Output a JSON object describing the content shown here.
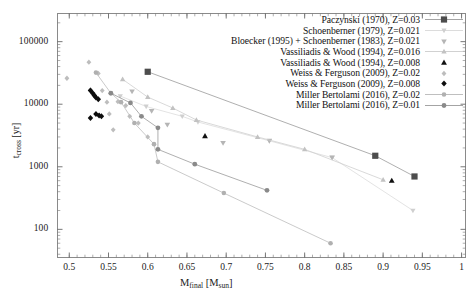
{
  "figure": {
    "title_fragment": "",
    "xlabel_main": "M",
    "xlabel_sub": "final",
    "xlabel_unit": "[M",
    "xlabel_unit_sub": "sun",
    "xlabel_unit_end": "]",
    "ylabel_main": "t",
    "ylabel_sub": "cross",
    "ylabel_unit": "[yr]"
  },
  "axes": {
    "x_ticks": [
      "0.5",
      "0.55",
      "0.6",
      "0.65",
      "0.7",
      "0.75",
      "0.8",
      "0.85",
      "0.9",
      "0.95",
      "1"
    ],
    "y_ticks": [
      "100000",
      "10000",
      "1000",
      "100"
    ],
    "xlim": [
      0.485,
      1.005
    ],
    "ylim_log": [
      1.55,
      5.45
    ],
    "yscale": "log",
    "grid": false
  },
  "legend": {
    "position": "top-right",
    "entries": [
      {
        "label": "Paczynski (1970), Z=0.03",
        "marker": "square",
        "color": "#4d4d4d",
        "size": 6.2,
        "line": true,
        "line_color": "#9a9a9a"
      },
      {
        "label": "Schoenberner (1979), Z=0.021",
        "marker": "tri-down",
        "color": "#cfcfcf",
        "size": 4.6,
        "line": true,
        "line_color": "#d8d8d8"
      },
      {
        "label": "Bloecker (1995) + Schoenberner (1983), Z=0.021",
        "marker": "tri-down",
        "color": "#b5b5b5",
        "size": 5.0,
        "line": false,
        "line_color": "#c8c8c8"
      },
      {
        "label": "Vassiliadis & Wood (1994), Z=0.016",
        "marker": "tri-up",
        "color": "#c2c2c2",
        "size": 4.8,
        "line": true,
        "line_color": "#cccccc"
      },
      {
        "label": "Vassiliadis & Wood (1994), Z=0.008",
        "marker": "tri-up",
        "color": "#111111",
        "size": 5.2,
        "line": false,
        "line_color": "#999999"
      },
      {
        "label": "Weiss & Ferguson (2009), Z=0.02",
        "marker": "diamond",
        "color": "#bdbdbd",
        "size": 4.6,
        "line": false,
        "line_color": "#bdbdbd"
      },
      {
        "label": "Weiss & Ferguson (2009), Z=0.008",
        "marker": "diamond",
        "color": "#0d0d0d",
        "size": 5.2,
        "line": false,
        "line_color": "#0d0d0d"
      },
      {
        "label": "Miller Bertolami (2016), Z=0.02",
        "marker": "circle",
        "color": "#b0b0b0",
        "size": 4.6,
        "line": true,
        "line_color": "#b8b8b8"
      },
      {
        "label": "Miller Bertolami (2016), Z=0.01",
        "marker": "circle",
        "color": "#8a8a8a",
        "size": 4.8,
        "line": true,
        "line_color": "#9a9a9a"
      }
    ]
  },
  "chart_data": {
    "type": "scatter",
    "title": "",
    "xlabel": "M_final [M_sun]",
    "ylabel": "t_cross [yr]",
    "yscale": "log",
    "xlim": [
      0.485,
      1.005
    ],
    "ylim": [
      40,
      300000
    ],
    "grid": false,
    "series": [
      {
        "name": "Paczynski (1970), Z=0.03",
        "marker": "square",
        "color": "#4d4d4d",
        "line": true,
        "line_color": "#9a9a9a",
        "points": [
          [
            0.6,
            33000
          ],
          [
            0.89,
            1500
          ],
          [
            0.94,
            700
          ]
        ]
      },
      {
        "name": "Schoenberner (1979), Z=0.021",
        "marker": "tri-down",
        "color": "#cfcfcf",
        "line": true,
        "line_color": "#dcdcdc",
        "points": [
          [
            0.565,
            13500
          ],
          [
            0.598,
            9200
          ],
          [
            0.644,
            6400
          ],
          [
            0.664,
            5200
          ],
          [
            0.755,
            2600
          ],
          [
            0.835,
            1400
          ],
          [
            0.938,
            200
          ]
        ]
      },
      {
        "name": "Bloecker (1995) + Schoenberner (1983), Z=0.021",
        "marker": "tri-down",
        "color": "#b5b5b5",
        "line": false,
        "line_color": "#c8c8c8",
        "points": [
          [
            0.58,
            16000
          ],
          [
            0.605,
            7800
          ],
          [
            0.625,
            4700
          ],
          [
            0.696,
            2400
          ],
          [
            0.755,
            2600
          ],
          [
            0.835,
            1400
          ]
        ]
      },
      {
        "name": "Vassiliadis & Wood (1994), Z=0.016",
        "marker": "tri-up",
        "color": "#c2c2c2",
        "line": true,
        "line_color": "#cfcfcf",
        "points": [
          [
            0.568,
            25000
          ],
          [
            0.6,
            13000
          ],
          [
            0.632,
            8700
          ],
          [
            0.662,
            5600
          ],
          [
            0.74,
            3000
          ],
          [
            0.8,
            1900
          ],
          [
            0.9,
            620
          ]
        ]
      },
      {
        "name": "Vassiliadis & Wood (1994), Z=0.008",
        "marker": "tri-up",
        "color": "#111111",
        "line": false,
        "line_color": "#999999",
        "points": [
          [
            0.673,
            3100
          ],
          [
            0.911,
            600
          ]
        ]
      },
      {
        "name": "Weiss & Ferguson (2009), Z=0.02",
        "marker": "diamond",
        "color": "#bdbdbd",
        "line": false,
        "line_color": "#bdbdbd",
        "points": [
          [
            0.497,
            26000
          ],
          [
            0.525,
            47000
          ],
          [
            0.527,
            17000
          ],
          [
            0.53,
            14500
          ],
          [
            0.537,
            31000
          ],
          [
            0.542,
            16500
          ],
          [
            0.548,
            10800
          ],
          [
            0.551,
            7000
          ],
          [
            0.556,
            3900
          ],
          [
            0.562,
            11000
          ],
          [
            0.572,
            9500
          ],
          [
            0.577,
            6400
          ],
          [
            0.588,
            5000
          ],
          [
            0.6,
            3000
          ]
        ]
      },
      {
        "name": "Weiss & Ferguson (2009), Z=0.008",
        "marker": "diamond",
        "color": "#0d0d0d",
        "line": false,
        "line_color": "#0d0d0d",
        "points": [
          [
            0.527,
            16500
          ],
          [
            0.53,
            15000
          ],
          [
            0.532,
            13800
          ],
          [
            0.534,
            12800
          ],
          [
            0.537,
            12000
          ],
          [
            0.527,
            6000
          ],
          [
            0.534,
            7000
          ],
          [
            0.538,
            6600
          ],
          [
            0.541,
            6400
          ]
        ]
      },
      {
        "name": "Miller Bertolami (2016), Z=0.02",
        "marker": "circle",
        "color": "#b0b0b0",
        "line": true,
        "line_color": "#bcbcbc",
        "points": [
          [
            0.534,
            32000
          ],
          [
            0.553,
            15000
          ],
          [
            0.566,
            10800
          ],
          [
            0.583,
            5000
          ],
          [
            0.608,
            2300
          ],
          [
            0.613,
            1200
          ],
          [
            0.697,
            380
          ],
          [
            0.833,
            60
          ]
        ]
      },
      {
        "name": "Miller Bertolami (2016), Z=0.01",
        "marker": "circle",
        "color": "#8a8a8a",
        "line": true,
        "line_color": "#9a9a9a",
        "points": [
          [
            0.553,
            15000
          ],
          [
            0.578,
            10500
          ],
          [
            0.592,
            6400
          ],
          [
            0.613,
            4200
          ],
          [
            0.613,
            1900
          ],
          [
            0.66,
            1100
          ],
          [
            0.752,
            420
          ]
        ]
      }
    ]
  }
}
